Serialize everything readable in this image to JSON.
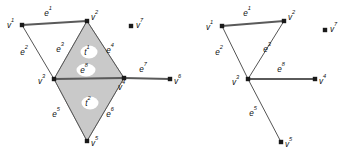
{
  "figure": {
    "background_color": "#ffffff",
    "shade_color": "#c9c9c9",
    "line_color": "#555555",
    "dot_color": "#1a1a1a"
  },
  "panels": [
    {
      "id": "left-panel",
      "name": "shaded-complex",
      "vertices": [
        {
          "id": "v1",
          "label": "v",
          "sup": "1",
          "x": 22,
          "y": 25,
          "label_x": 7,
          "label_y": 28,
          "label_anchor": "start"
        },
        {
          "id": "v2",
          "label": "v",
          "sup": "2",
          "x": 87,
          "y": 21,
          "label_x": 91,
          "label_y": 20,
          "label_anchor": "start"
        },
        {
          "id": "v3",
          "label": "v",
          "sup": "3",
          "x": 54,
          "y": 79,
          "label_x": 38,
          "label_y": 84,
          "label_anchor": "start"
        },
        {
          "id": "v4",
          "label": "v",
          "sup": "4",
          "x": 124,
          "y": 78,
          "label_x": 118,
          "label_y": 90,
          "label_anchor": "start"
        },
        {
          "id": "v5",
          "label": "v",
          "sup": "5",
          "x": 87,
          "y": 141,
          "label_x": 91,
          "label_y": 146,
          "label_anchor": "start"
        },
        {
          "id": "v6",
          "label": "v",
          "sup": "6",
          "x": 170,
          "y": 79,
          "label_x": 174,
          "label_y": 84,
          "label_anchor": "start"
        },
        {
          "id": "v7",
          "label": "v",
          "sup": "7",
          "x": 131,
          "y": 26,
          "label_x": 136,
          "label_y": 28,
          "label_anchor": "start"
        }
      ],
      "edges": [
        {
          "id": "e1",
          "from": "v1",
          "to": "v2",
          "thick": true,
          "label": "e",
          "sup": "1",
          "label_x": 48,
          "label_y": 16
        },
        {
          "id": "e2",
          "from": "v1",
          "to": "v3",
          "thick": false,
          "label": "e",
          "sup": "2",
          "label_x": 24,
          "label_y": 55
        },
        {
          "id": "e3",
          "from": "v2",
          "to": "v3",
          "thick": false,
          "label": "e",
          "sup": "3",
          "label_x": 60,
          "label_y": 52
        },
        {
          "id": "e4",
          "from": "v2",
          "to": "v4",
          "thick": false,
          "label": "e",
          "sup": "4",
          "label_x": 110,
          "label_y": 53
        },
        {
          "id": "e5",
          "from": "v3",
          "to": "v5",
          "thick": false,
          "label": "e",
          "sup": "5",
          "label_x": 56,
          "label_y": 117
        },
        {
          "id": "e6",
          "from": "v5",
          "to": "v4",
          "thick": false,
          "label": "e",
          "sup": "6",
          "label_x": 110,
          "label_y": 117
        },
        {
          "id": "e7",
          "from": "v4",
          "to": "v6",
          "thick": true,
          "label": "e",
          "sup": "7",
          "label_x": 143,
          "label_y": 72
        },
        {
          "id": "e8",
          "from": "v3",
          "to": "v4",
          "thick": true,
          "label": "e",
          "sup": "8",
          "label_x": 84,
          "label_y": 73
        }
      ],
      "faces": [
        {
          "id": "t1",
          "vertices": [
            "v2",
            "v3",
            "v4"
          ],
          "label": "t",
          "sup": "1",
          "label_x": 87,
          "label_y": 55
        },
        {
          "id": "t2",
          "vertices": [
            "v3",
            "v5",
            "v4"
          ],
          "label": "t",
          "sup": "2",
          "label_x": 88,
          "label_y": 106
        }
      ]
    },
    {
      "id": "right-panel",
      "name": "edge-skeleton",
      "vertices": [
        {
          "id": "v1",
          "label": "v",
          "sup": "1",
          "x": 222,
          "y": 26,
          "label_x": 206,
          "label_y": 30,
          "label_anchor": "start"
        },
        {
          "id": "v2",
          "label": "v",
          "sup": "2",
          "x": 284,
          "y": 21,
          "label_x": 288,
          "label_y": 20,
          "label_anchor": "start"
        },
        {
          "id": "v3",
          "label": "v",
          "sup": "3",
          "x": 248,
          "y": 79,
          "label_x": 232,
          "label_y": 85,
          "label_anchor": "start"
        },
        {
          "id": "v4",
          "label": "v",
          "sup": "4",
          "x": 315,
          "y": 79,
          "label_x": 319,
          "label_y": 84,
          "label_anchor": "start"
        },
        {
          "id": "v5",
          "label": "v",
          "sup": "5",
          "x": 281,
          "y": 142,
          "label_x": 285,
          "label_y": 147,
          "label_anchor": "start"
        },
        {
          "id": "v7",
          "label": "v",
          "sup": "7",
          "x": 325,
          "y": 30,
          "label_x": 330,
          "label_y": 32,
          "label_anchor": "start"
        }
      ],
      "edges": [
        {
          "id": "e1",
          "from": "v1",
          "to": "v2",
          "thick": true,
          "label": "e",
          "sup": "1",
          "label_x": 247,
          "label_y": 16
        },
        {
          "id": "e2",
          "from": "v1",
          "to": "v3",
          "thick": false,
          "label": "e",
          "sup": "2",
          "label_x": 219,
          "label_y": 55
        },
        {
          "id": "e3",
          "from": "v2",
          "to": "v3",
          "thick": false,
          "label": "e",
          "sup": "3",
          "label_x": 267,
          "label_y": 52
        },
        {
          "id": "e5",
          "from": "v3",
          "to": "v5",
          "thick": false,
          "label": "e",
          "sup": "5",
          "label_x": 253,
          "label_y": 116
        },
        {
          "id": "e8",
          "from": "v3",
          "to": "v4",
          "thick": true,
          "label": "e",
          "sup": "8",
          "label_x": 281,
          "label_y": 72
        }
      ],
      "faces": []
    }
  ]
}
